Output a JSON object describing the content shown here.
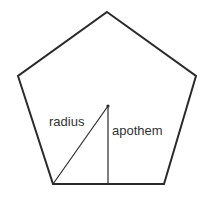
{
  "diagram": {
    "shape": "regular pentagon",
    "labels": {
      "radius": "radius",
      "apothem": "apothem"
    },
    "colors": {
      "stroke": "#2a2a2a",
      "text": "#333333",
      "background": "#ffffff"
    },
    "vertices": [
      [
        107,
        12
      ],
      [
        196,
        76
      ],
      [
        164,
        184
      ],
      [
        53,
        184
      ],
      [
        18,
        76
      ]
    ],
    "center": [
      108,
      106
    ]
  }
}
